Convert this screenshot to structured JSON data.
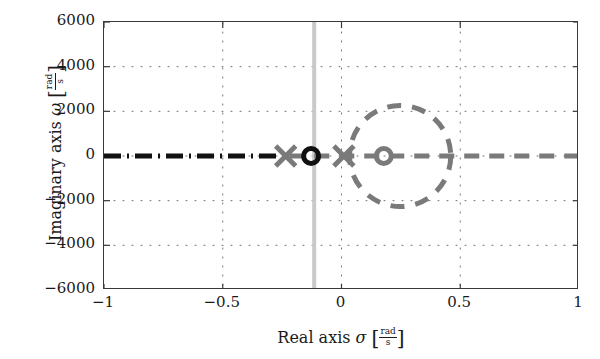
{
  "chart_data": {
    "type": "scatter",
    "title": "",
    "xlabel": "Real axis σ [rad/s]",
    "ylabel": "Imaginary axis ω [rad/s]",
    "xlabel_text": "Real axis",
    "xlabel_symbol": "σ",
    "ylabel_text": "Imaginary axis",
    "ylabel_symbol": "ω",
    "unit_numerator": "rad",
    "unit_denominator": "s",
    "xlim": [
      -1,
      1
    ],
    "ylim": [
      -6000,
      6000
    ],
    "xticks": [
      "-1",
      "-0.5",
      "0",
      "0.5",
      "1"
    ],
    "xtick_values": [
      -1,
      -0.5,
      0,
      0.5,
      1
    ],
    "yticks": [
      "6000",
      "4000",
      "2000",
      "0",
      "-2000",
      "-4000",
      "-6000"
    ],
    "ytick_values": [
      6000,
      4000,
      2000,
      0,
      -2000,
      -4000,
      -6000
    ],
    "grid": "dotted",
    "legend": "none",
    "series": [
      {
        "name": "poles",
        "marker": "x",
        "color": "#7a7a7a",
        "points": [
          {
            "x": -0.235,
            "y": 0
          },
          {
            "x": 0.01,
            "y": 0
          }
        ]
      },
      {
        "name": "zeros-black",
        "marker": "o",
        "color": "#111111",
        "points": [
          {
            "x": -0.128,
            "y": 0
          }
        ]
      },
      {
        "name": "zeros-gray",
        "marker": "o",
        "color": "#7a7a7a",
        "points": [
          {
            "x": 0.178,
            "y": 0
          }
        ]
      }
    ],
    "loci": [
      {
        "name": "real-axis-locus-left",
        "style": "dash-dot",
        "color": "#111111",
        "from": {
          "x": -1.0,
          "y": 0
        },
        "to": {
          "x": -0.225,
          "y": 0
        }
      },
      {
        "name": "real-axis-locus-right",
        "style": "dashed",
        "color": "#7a7a7a",
        "from": {
          "x": -0.22,
          "y": 0
        },
        "to": {
          "x": 1.0,
          "y": 0
        }
      },
      {
        "name": "circular-locus",
        "style": "dashed",
        "color": "#7a7a7a",
        "shape": "circle",
        "center": {
          "x": 0.247,
          "y": 0
        },
        "radius": 0.213,
        "radius_omega": 2320
      }
    ],
    "markers_vertical_line": {
      "name": "asymptote-line",
      "color": "#c9c9c9",
      "x": -0.115,
      "style": "solid"
    },
    "annotations": []
  }
}
